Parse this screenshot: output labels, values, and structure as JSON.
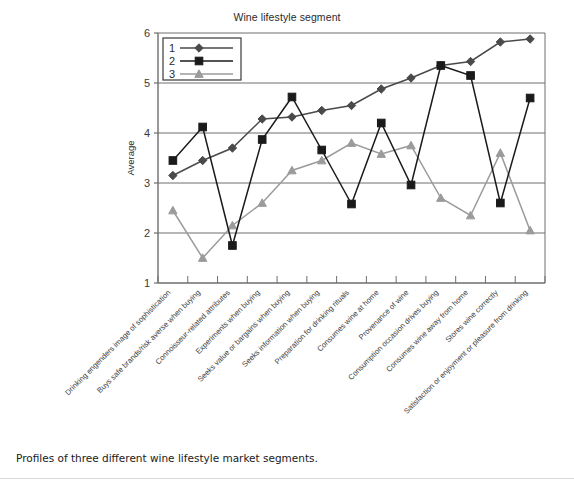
{
  "figure": {
    "caption": "Profiles of three different wine lifestyle market segments."
  },
  "chart_data": {
    "type": "line",
    "title": "Wine lifestyle segment",
    "xlabel": "",
    "ylabel": "Average",
    "ylim": [
      1,
      6
    ],
    "yticks": [
      1,
      2,
      3,
      4,
      5,
      6
    ],
    "grid": "horizontal",
    "legend_position": "top-left-inside",
    "markers": {
      "1": "diamond",
      "2": "square",
      "3": "triangle"
    },
    "colors": {
      "series1": "#4a4a4a",
      "series2": "#1a1a1a",
      "series3": "#9b9b9b",
      "grid": "#6e6e6e",
      "axis": "#6e6e6e"
    },
    "categories": [
      "Drinking engenders image of sophistication",
      "Buys safe brands/risk averse when buying",
      "Connoisseur-related attributes",
      "Experiments when buying",
      "Seeks value or bargains when buying",
      "Seeks information when buying",
      "Preparation for drinking rituals",
      "Consumes wine at home",
      "Provenance of wine",
      "Consumption occasion drives buying",
      "Consumes wine away from home",
      "Stores wine correctly",
      "Satisfaction or enjoyment or pleasure from drinking"
    ],
    "series": [
      {
        "name": "1",
        "values": [
          3.15,
          3.45,
          3.7,
          4.28,
          4.32,
          4.45,
          4.55,
          4.88,
          5.1,
          5.35,
          5.43,
          5.82,
          5.88
        ]
      },
      {
        "name": "2",
        "values": [
          3.45,
          4.12,
          1.75,
          3.87,
          4.72,
          3.66,
          2.58,
          4.2,
          2.96,
          5.35,
          5.15,
          2.6,
          4.7
        ]
      },
      {
        "name": "3",
        "values": [
          2.45,
          1.5,
          2.15,
          2.6,
          3.25,
          3.45,
          3.8,
          3.58,
          3.75,
          2.7,
          2.35,
          3.6,
          2.05
        ]
      }
    ]
  }
}
